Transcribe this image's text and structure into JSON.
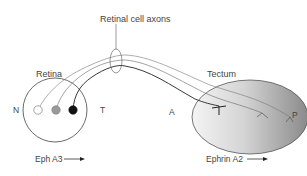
{
  "diagram": {
    "title_label": "Retinal cell axons",
    "retina": {
      "label": "Retina",
      "nasal_label": "N",
      "temporal_label": "T",
      "cells": [
        {
          "name": "nasal-cell",
          "fill": "#ffffff"
        },
        {
          "name": "middle-cell",
          "fill": "#9a9a9a"
        },
        {
          "name": "temporal-cell",
          "fill": "#111111"
        }
      ],
      "gradient_label": "Eph A3",
      "gradient_arrow": "→"
    },
    "tectum": {
      "label": "Tectum",
      "anterior_label": "A",
      "posterior_label": "P",
      "gradient_label": "Ephrin A2",
      "gradient_arrow": "→",
      "gradient_colors": [
        "#f2f2f2",
        "#8f8f8f"
      ]
    },
    "colors": {
      "line": "#444444",
      "axon_light": "#777777",
      "axon_dark": "#222222"
    }
  }
}
